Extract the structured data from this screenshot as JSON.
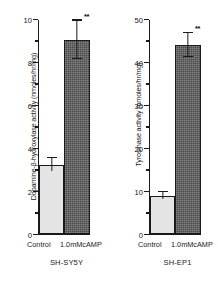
{
  "chart_data": [
    {
      "type": "bar",
      "panel_id": "left",
      "title": "",
      "cell_line": "SH-SY5Y",
      "ylabel": "Dopamine-β-hydroxylase activity (nmoles/hr/mg)",
      "xlabel": "",
      "ylim": [
        0,
        10
      ],
      "yticks_major": [
        0,
        2,
        4,
        6,
        8,
        10
      ],
      "ytick_labels": [
        "0",
        "2",
        "4",
        "6",
        "8",
        "10"
      ],
      "yticks_minor": [
        1,
        3,
        5,
        7,
        9
      ],
      "grid": false,
      "legend": "none",
      "categories": [
        "Control",
        "1.0mM cAMP"
      ],
      "values": [
        3.2,
        9.0
      ],
      "errors": [
        0.3,
        0.9
      ],
      "annotations": [
        {
          "category": "1.0mM cAMP",
          "text": "**",
          "meaning": "significance-marker"
        }
      ]
    },
    {
      "type": "bar",
      "panel_id": "right",
      "title": "",
      "cell_line": "SH-EP1",
      "ylabel": "Tyrosinase activity (pmoles/hr/mg)",
      "xlabel": "",
      "ylim": [
        0,
        50
      ],
      "yticks_major": [
        0,
        10,
        20,
        30,
        40,
        50
      ],
      "ytick_labels": [
        "0",
        "10",
        "20",
        "30",
        "40",
        "50"
      ],
      "yticks_minor": [
        5,
        15,
        25,
        35,
        45
      ],
      "grid": false,
      "legend": "none",
      "categories": [
        "Control",
        "1.0mM cAMP"
      ],
      "values": [
        8.8,
        43.8
      ],
      "errors": [
        0.8,
        2.8
      ],
      "annotations": [
        {
          "category": "1.0mM cAMP",
          "text": "**",
          "meaning": "significance-marker"
        }
      ]
    }
  ],
  "left_panel": {
    "ylabel": "Dopamine-β-hydroxylase activity (nmoles/hr/mg)",
    "cell_line": "SH-SY5Y",
    "x_control": "Control",
    "x_treated": "1.0mMcAMP",
    "sig_marker": "**",
    "ytick_0": "0",
    "ytick_1": "2",
    "ytick_2": "4",
    "ytick_3": "6",
    "ytick_4": "8",
    "ytick_5": "10"
  },
  "right_panel": {
    "ylabel": "Tyrosinase activity (pmoles/hr/mg)",
    "cell_line": "SH-EP1",
    "x_control": "Control",
    "x_treated": "1.0mMcAMP",
    "sig_marker": "**",
    "ytick_0": "0",
    "ytick_1": "10",
    "ytick_2": "20",
    "ytick_3": "30",
    "ytick_4": "40",
    "ytick_5": "50"
  },
  "colors": {
    "control_bar": "#e4e4e4",
    "treated_bar": "#4a4a4a",
    "axis": "#1a1a1a",
    "background": "#ffffff"
  }
}
